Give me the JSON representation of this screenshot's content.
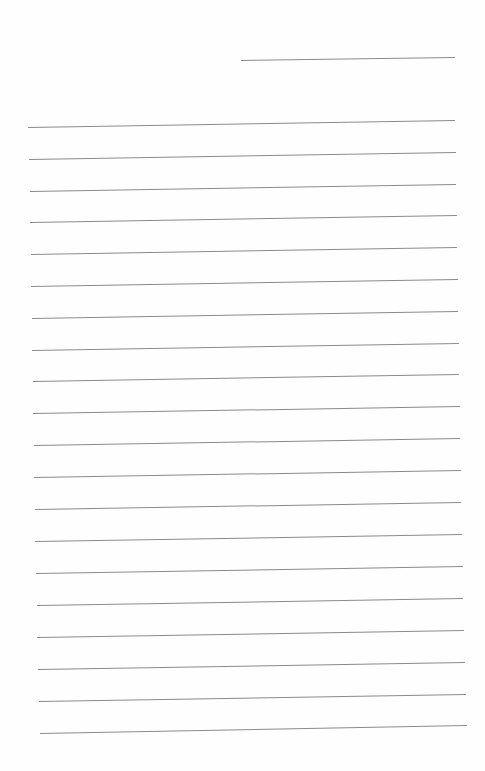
{
  "page": {
    "type": "ruled-paper",
    "background_color": "#fefefe",
    "line_color": "#8a8a8a",
    "header_line": {
      "x1": 241,
      "y1": 60,
      "x2": 455,
      "y2": 57
    },
    "lines": [
      {
        "x1": 28,
        "y1": 127,
        "x2": 455,
        "y2": 120
      },
      {
        "x1": 29,
        "y1": 159,
        "x2": 456,
        "y2": 152
      },
      {
        "x1": 30,
        "y1": 191,
        "x2": 456,
        "y2": 184
      },
      {
        "x1": 30,
        "y1": 222,
        "x2": 457,
        "y2": 215
      },
      {
        "x1": 31,
        "y1": 254,
        "x2": 457,
        "y2": 247
      },
      {
        "x1": 31,
        "y1": 286,
        "x2": 458,
        "y2": 279
      },
      {
        "x1": 32,
        "y1": 318,
        "x2": 458,
        "y2": 311
      },
      {
        "x1": 32,
        "y1": 350,
        "x2": 459,
        "y2": 343
      },
      {
        "x1": 33,
        "y1": 381,
        "x2": 459,
        "y2": 374
      },
      {
        "x1": 33,
        "y1": 413,
        "x2": 460,
        "y2": 406
      },
      {
        "x1": 34,
        "y1": 445,
        "x2": 460,
        "y2": 438
      },
      {
        "x1": 34,
        "y1": 477,
        "x2": 461,
        "y2": 470
      },
      {
        "x1": 35,
        "y1": 509,
        "x2": 461,
        "y2": 502
      },
      {
        "x1": 35,
        "y1": 541,
        "x2": 462,
        "y2": 534
      },
      {
        "x1": 36,
        "y1": 573,
        "x2": 463,
        "y2": 566
      },
      {
        "x1": 37,
        "y1": 605,
        "x2": 463,
        "y2": 598
      },
      {
        "x1": 37,
        "y1": 637,
        "x2": 464,
        "y2": 630
      },
      {
        "x1": 38,
        "y1": 669,
        "x2": 465,
        "y2": 662
      },
      {
        "x1": 39,
        "y1": 701,
        "x2": 466,
        "y2": 694
      },
      {
        "x1": 40,
        "y1": 733,
        "x2": 467,
        "y2": 725
      }
    ]
  }
}
